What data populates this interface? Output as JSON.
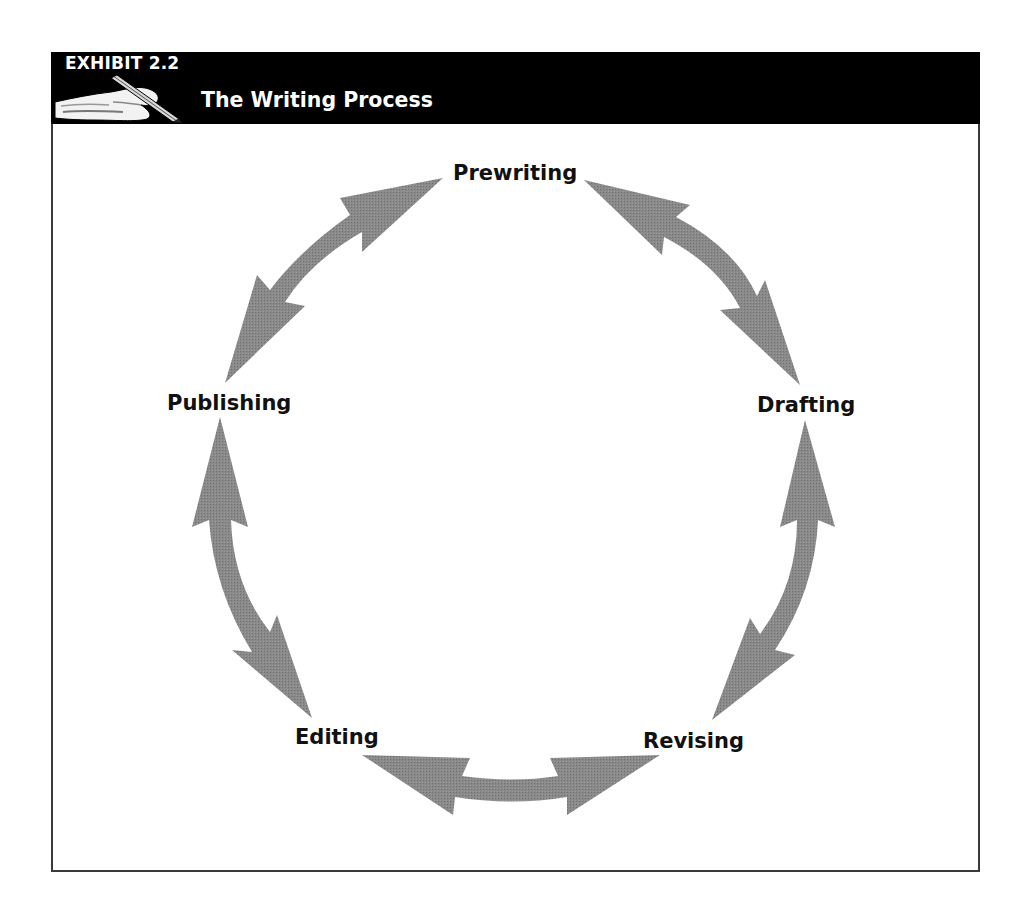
{
  "exhibit": {
    "number": "EXHIBIT 2.2",
    "title": "The Writing Process",
    "icon": "hand-writing-with-pencil-icon"
  },
  "diagram": {
    "type": "cycle",
    "arrow_color": "#858585",
    "arrow_style": "double-headed curved arrows",
    "stages": [
      {
        "id": "prewriting",
        "label": "Prewriting"
      },
      {
        "id": "drafting",
        "label": "Drafting"
      },
      {
        "id": "revising",
        "label": "Revising"
      },
      {
        "id": "editing",
        "label": "Editing"
      },
      {
        "id": "publishing",
        "label": "Publishing"
      }
    ],
    "connections": [
      {
        "from": "Prewriting",
        "to": "Drafting",
        "bidirectional": true
      },
      {
        "from": "Drafting",
        "to": "Revising",
        "bidirectional": true
      },
      {
        "from": "Revising",
        "to": "Editing",
        "bidirectional": true
      },
      {
        "from": "Editing",
        "to": "Publishing",
        "bidirectional": true
      },
      {
        "from": "Publishing",
        "to": "Prewriting",
        "bidirectional": true
      }
    ]
  }
}
